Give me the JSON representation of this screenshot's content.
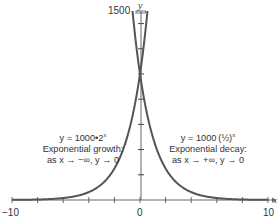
{
  "chart_data": {
    "type": "line",
    "title": "",
    "xlabel": "x",
    "ylabel": "y",
    "xlim": [
      -10,
      10
    ],
    "ylim": [
      0,
      1500
    ],
    "x_tick_labels": [
      "-10",
      "0",
      "10"
    ],
    "x_ticks": [
      -10,
      -8,
      -6,
      -4,
      -2,
      0,
      2,
      4,
      6,
      8,
      10
    ],
    "y_tick_labels": [
      "1500"
    ],
    "y_ticks": [
      200,
      400,
      600,
      800,
      1000,
      1200,
      1400
    ],
    "grid": false,
    "legend": null,
    "series": [
      {
        "name": "y = 1000·2^x",
        "formula": "1000*2^x",
        "x": [
          -10,
          -8,
          -6,
          -4,
          -3,
          -2,
          -1,
          -0.5,
          0,
          0.3,
          0.585
        ],
        "values": [
          0.98,
          3.9,
          15.6,
          62.5,
          125,
          250,
          500,
          707,
          1000,
          1231,
          1500
        ]
      },
      {
        "name": "y = 1000·(1/2)^x",
        "formula": "1000*(1/2)^x",
        "x": [
          -0.585,
          -0.3,
          0,
          0.5,
          1,
          2,
          3,
          4,
          6,
          8,
          10
        ],
        "values": [
          1500,
          1231,
          1000,
          707,
          500,
          250,
          125,
          62.5,
          15.6,
          3.9,
          0.98
        ]
      }
    ],
    "annotations": [
      {
        "lines": [
          "y = 1000•2^x",
          "Exponential growth:",
          "as x → −∞, y → 0"
        ]
      },
      {
        "lines": [
          "y = 1000 (1/2)^x",
          "Exponential decay:",
          "as x → +∞, y → 0"
        ]
      }
    ]
  },
  "axes": {
    "x_label": "x",
    "y_label": "y",
    "x_min_label": "−10",
    "x_zero_label": "0",
    "x_max_label": "10",
    "y_max_label": "1500"
  },
  "growth": {
    "formula_prefix": "y = 1000•2",
    "formula_exp": "x",
    "title": "Exponential growth:",
    "limit": "as x → −∞, y → 0"
  },
  "decay": {
    "formula_prefix": "y = 1000",
    "formula_base": "(½)",
    "formula_exp": "x",
    "title": "Exponential decay:",
    "limit": "as x → +∞, y → 0"
  },
  "colors": {
    "curve": "#555555",
    "axis": "#666666",
    "text": "#333333"
  }
}
